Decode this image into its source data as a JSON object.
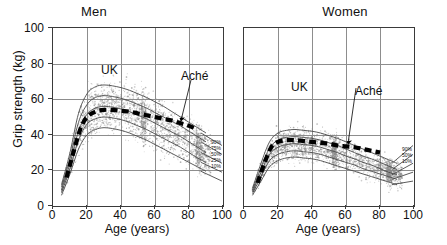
{
  "figure": {
    "y_axis_title": "Grip strength (kg)",
    "x_axis_title": "Age (years)",
    "y_ticks": [
      "0",
      "20",
      "40",
      "60",
      "80",
      "100"
    ],
    "x_ticks": [
      "0",
      "20",
      "40",
      "60",
      "80",
      "100"
    ]
  },
  "panels": {
    "men": {
      "title": "Men",
      "annotations": {
        "uk": "UK",
        "ache": "Aché"
      },
      "legend": [
        "90%",
        "75%",
        "50%",
        "25%",
        "10%"
      ]
    },
    "women": {
      "title": "Women",
      "annotations": {
        "uk": "UK",
        "ache": "Aché"
      },
      "legend": [
        "90%",
        "50%",
        "10%"
      ]
    }
  },
  "chart_data": {
    "type": "line",
    "xlabel": "Age (years)",
    "ylabel": "Grip strength (kg)",
    "xlim": [
      0,
      100
    ],
    "ylim": [
      0,
      100
    ],
    "xticks": [
      0,
      20,
      40,
      60,
      80,
      100
    ],
    "yticks": [
      0,
      20,
      40,
      60,
      80,
      100
    ],
    "grid": true,
    "legend_position": "inside-right",
    "panels": [
      {
        "name": "Men",
        "annotations": [
          {
            "text": "UK",
            "x": 32,
            "y": 72
          },
          {
            "text": "Aché",
            "x": 80,
            "y": 64
          }
        ],
        "series": [
          {
            "name": "UK 90%",
            "style": "thin-line",
            "x": [
              5,
              10,
              15,
              20,
              25,
              30,
              35,
              40,
              45,
              50,
              55,
              60,
              65,
              70,
              75,
              80,
              85,
              90
            ],
            "y": [
              12,
              30,
              52,
              63,
              67,
              68,
              67.5,
              66.5,
              65,
              63,
              61,
              58.5,
              56,
              53,
              50,
              47,
              44,
              41
            ]
          },
          {
            "name": "UK 75%",
            "style": "thin-line",
            "x": [
              5,
              10,
              15,
              20,
              25,
              30,
              35,
              40,
              45,
              50,
              55,
              60,
              65,
              70,
              75,
              80,
              85,
              90
            ],
            "y": [
              10.5,
              27,
              47,
              57,
              61,
              62,
              61.5,
              60.5,
              59,
              57,
              55,
              52.5,
              50,
              47.5,
              45,
              42,
              39,
              36
            ]
          },
          {
            "name": "UK 50%",
            "style": "thin-line",
            "x": [
              5,
              10,
              15,
              20,
              25,
              30,
              35,
              40,
              45,
              50,
              55,
              60,
              65,
              70,
              75,
              80,
              85,
              90
            ],
            "y": [
              9,
              24,
              42,
              51.5,
              55,
              56,
              55.5,
              54.5,
              53,
              51,
              49,
              46.5,
              44,
              41.5,
              39,
              36,
              33,
              30
            ]
          },
          {
            "name": "UK 25%",
            "style": "thin-line",
            "x": [
              5,
              10,
              15,
              20,
              25,
              30,
              35,
              40,
              45,
              50,
              55,
              60,
              65,
              70,
              75,
              80,
              85,
              90
            ],
            "y": [
              7.5,
              21,
              37,
              46,
              49,
              50,
              49.5,
              48.5,
              47,
              45,
              43,
              40.5,
              38,
              35.5,
              33,
              30,
              27,
              24.5
            ]
          },
          {
            "name": "UK 10%",
            "style": "thin-line",
            "x": [
              5,
              10,
              15,
              20,
              25,
              30,
              35,
              40,
              45,
              50,
              55,
              60,
              65,
              70,
              75,
              80,
              85,
              90
            ],
            "y": [
              6,
              18,
              32,
              40,
              43,
              44,
              43.5,
              42.5,
              41,
              39,
              37,
              34.5,
              32,
              29.5,
              27,
              24.5,
              22,
              19.5
            ]
          },
          {
            "name": "Aché median",
            "style": "thick-dashed",
            "x": [
              8,
              12,
              16,
              20,
              25,
              30,
              35,
              40,
              45,
              50,
              55,
              60,
              65,
              70,
              75,
              80,
              85
            ],
            "y": [
              16,
              30,
              43,
              50,
              53,
              54,
              54,
              53.5,
              53,
              52,
              51,
              50,
              49,
              48,
              46.5,
              45,
              43
            ]
          }
        ]
      },
      {
        "name": "Women",
        "annotations": [
          {
            "text": "UK",
            "x": 30,
            "y": 55
          },
          {
            "text": "Aché",
            "x": 70,
            "y": 53
          }
        ],
        "series": [
          {
            "name": "UK 90%",
            "style": "thin-line",
            "x": [
              5,
              10,
              15,
              20,
              25,
              30,
              35,
              40,
              45,
              50,
              55,
              60,
              65,
              70,
              75,
              80,
              85,
              90
            ],
            "y": [
              10,
              24,
              36,
              41,
              42.5,
              43,
              42.5,
              42,
              41,
              39.5,
              38,
              36,
              34,
              32,
              30,
              28,
              26,
              24
            ]
          },
          {
            "name": "UK 75%",
            "style": "thin-line",
            "x": [
              5,
              10,
              15,
              20,
              25,
              30,
              35,
              40,
              45,
              50,
              55,
              60,
              65,
              70,
              75,
              80,
              85,
              90
            ],
            "y": [
              9,
              21.5,
              32.5,
              37,
              38.5,
              39,
              38.5,
              38,
              37,
              35.5,
              34,
              32,
              30,
              28,
              26.5,
              24.5,
              22.5,
              20.5
            ]
          },
          {
            "name": "UK 50%",
            "style": "thin-line",
            "x": [
              5,
              10,
              15,
              20,
              25,
              30,
              35,
              40,
              45,
              50,
              55,
              60,
              65,
              70,
              75,
              80,
              85,
              90
            ],
            "y": [
              8,
              19,
              29,
              33,
              34.5,
              35,
              34.5,
              34,
              33,
              31.5,
              30,
              28,
              26.5,
              24.5,
              23,
              21,
              19,
              17.5
            ]
          },
          {
            "name": "UK 25%",
            "style": "thin-line",
            "x": [
              5,
              10,
              15,
              20,
              25,
              30,
              35,
              40,
              45,
              50,
              55,
              60,
              65,
              70,
              75,
              80,
              85,
              90
            ],
            "y": [
              7,
              16.5,
              25.5,
              29,
              30.5,
              31,
              30.5,
              30,
              29,
              27.5,
              26,
              24.5,
              23,
              21,
              19.5,
              18,
              16.5,
              15
            ]
          },
          {
            "name": "UK 10%",
            "style": "thin-line",
            "x": [
              5,
              10,
              15,
              20,
              25,
              30,
              35,
              40,
              45,
              50,
              55,
              60,
              65,
              70,
              75,
              80,
              85,
              90
            ],
            "y": [
              6,
              14,
              22,
              25.5,
              27,
              27.5,
              27,
              26.5,
              25.5,
              24,
              22.5,
              21,
              19.5,
              18,
              16.5,
              15,
              13.5,
              12
            ]
          },
          {
            "name": "Aché median",
            "style": "thick-dashed",
            "x": [
              8,
              12,
              16,
              20,
              25,
              30,
              35,
              40,
              45,
              50,
              55,
              60,
              65,
              70,
              75,
              80
            ],
            "y": [
              13,
              24,
              33,
              36,
              37,
              37,
              36.5,
              36,
              35.5,
              35,
              34,
              33.5,
              33,
              32,
              31,
              30
            ]
          }
        ]
      }
    ]
  }
}
